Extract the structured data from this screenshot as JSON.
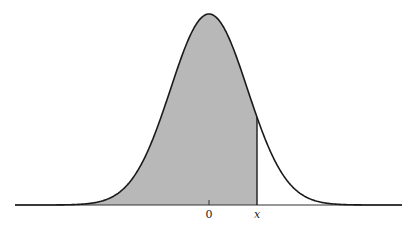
{
  "figure": {
    "type": "normal-distribution-shaded-area",
    "axis_labels": {
      "zero": "0",
      "x": "x"
    },
    "colors": {
      "curve": "#1a1a1a",
      "shade": "#b8b8b8",
      "axis": "#333333",
      "background": "#ffffff"
    },
    "geometry": {
      "baseline_y": 205,
      "mean_px": 209,
      "sigma_px": 38.5,
      "peak_height_px": 191,
      "x_cut_px": 257,
      "left_px": 15,
      "right_px": 402
    }
  }
}
